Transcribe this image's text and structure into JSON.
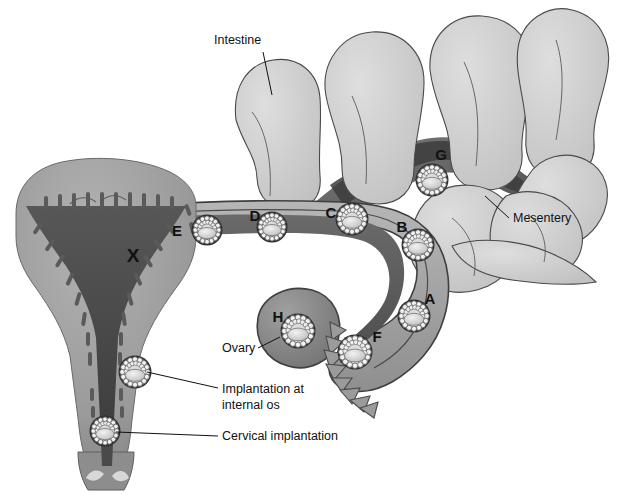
{
  "figure": {
    "type": "anatomical-diagram",
    "background_color": "#ffffff",
    "line_color": "#111111"
  },
  "palette": {
    "intestine_fill": "#c9c9c9",
    "intestine_stroke": "#4a4a4a",
    "mesentery_fill": "#6e6e6e",
    "mesentery_dark": "#3a3a3a",
    "uterus_body": "#9a9a9a",
    "uterus_cavity": "#4c4c4c",
    "endometrium": "#6f6f6f",
    "tube_wall": "#a8a8a8",
    "tube_lumen": "#5c5c5c",
    "ovary_fill": "#8a8a8a",
    "blastocyst_ring": "#e9e9e9",
    "blastocyst_core": "#cfcfcf"
  },
  "callouts": [
    {
      "id": "intestine",
      "label": "Intestine",
      "text_x": 214,
      "text_y": 44,
      "anchor": "start",
      "line": [
        [
          263,
          52
        ],
        [
          272,
          95
        ]
      ]
    },
    {
      "id": "mesentery",
      "label": "Mesentery",
      "text_x": 513,
      "text_y": 222,
      "anchor": "start",
      "line": [
        [
          509,
          218
        ],
        [
          485,
          196
        ]
      ]
    },
    {
      "id": "ovary",
      "label": "Ovary",
      "text_x": 222,
      "text_y": 352,
      "anchor": "start",
      "line": [
        [
          258,
          348
        ],
        [
          280,
          337
        ]
      ]
    },
    {
      "id": "internal-os",
      "label": "Implantation at",
      "label2": "internal os",
      "text_x": 222,
      "text_y": 393,
      "anchor": "start",
      "line": [
        [
          218,
          388
        ],
        [
          147,
          372
        ]
      ]
    },
    {
      "id": "cervical",
      "label": "Cervical implantation",
      "text_x": 222,
      "text_y": 440,
      "anchor": "start",
      "line": [
        [
          218,
          436
        ],
        [
          116,
          432
        ]
      ]
    }
  ],
  "sites": [
    {
      "key": "X",
      "label": "X",
      "label_x": 133,
      "label_y": 262,
      "big": true,
      "description": "normal uterine cavity implantation site",
      "blastocyst": null
    },
    {
      "key": "E",
      "label": "E",
      "label_x": 177,
      "label_y": 236,
      "big": false,
      "description": "interstitial / intramural tubal implantation",
      "blastocyst": {
        "cx": 207,
        "cy": 230,
        "r": 14
      }
    },
    {
      "key": "D",
      "label": "D",
      "label_x": 255,
      "label_y": 221,
      "big": false,
      "description": "isthmic tubal implantation",
      "blastocyst": {
        "cx": 272,
        "cy": 227,
        "r": 14
      }
    },
    {
      "key": "C",
      "label": "C",
      "label_x": 331,
      "label_y": 218,
      "big": false,
      "description": "ampullary tubal implantation",
      "blastocyst": {
        "cx": 352,
        "cy": 219,
        "r": 15
      }
    },
    {
      "key": "B",
      "label": "B",
      "label_x": 402,
      "label_y": 232,
      "big": false,
      "description": "distal ampullary / infundibular implantation",
      "blastocyst": {
        "cx": 418,
        "cy": 245,
        "r": 15
      }
    },
    {
      "key": "A",
      "label": "A",
      "label_x": 430,
      "label_y": 304,
      "big": false,
      "description": "fimbrial implantation",
      "blastocyst": {
        "cx": 414,
        "cy": 316,
        "r": 15
      }
    },
    {
      "key": "F",
      "label": "F",
      "label_x": 377,
      "label_y": 342,
      "big": false,
      "description": "infundibular / fimbrial ostium implantation",
      "blastocyst": {
        "cx": 355,
        "cy": 352,
        "r": 16
      }
    },
    {
      "key": "H",
      "label": "H",
      "label_x": 278,
      "label_y": 322,
      "big": false,
      "description": "ovarian implantation",
      "blastocyst": {
        "cx": 298,
        "cy": 331,
        "r": 16
      }
    },
    {
      "key": "G",
      "label": "G",
      "label_x": 441,
      "label_y": 160,
      "big": false,
      "description": "abdominal / mesenteric implantation",
      "blastocyst": {
        "cx": 432,
        "cy": 180,
        "r": 15
      }
    }
  ],
  "unlettered_blastocysts": [
    {
      "id": "internal-os-blastocyst",
      "cx": 135,
      "cy": 372,
      "r": 15
    },
    {
      "id": "cervical-blastocyst",
      "cx": 105,
      "cy": 431,
      "r": 14
    }
  ]
}
